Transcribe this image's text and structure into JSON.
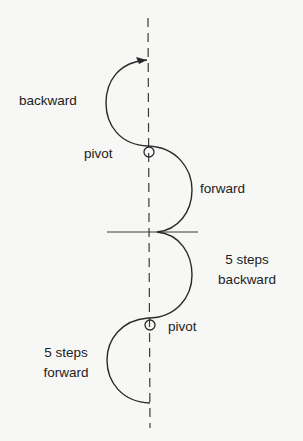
{
  "diagram": {
    "labels": {
      "backward": "backward",
      "pivot_top": "pivot",
      "forward": "forward",
      "steps_backward_1": "5 steps",
      "steps_backward_2": "backward",
      "pivot_bottom": "pivot",
      "steps_forward_1": "5 steps",
      "steps_forward_2": "forward"
    },
    "colors": {
      "stroke": "#2a2a2a",
      "dash": "#3a3a3a",
      "background": "#f7f7f5",
      "text": "#222222"
    }
  }
}
